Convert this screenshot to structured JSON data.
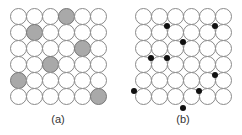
{
  "panels": [
    {
      "id": "a",
      "label": "(a)",
      "rows": 6,
      "cols": 6,
      "origin": [
        10,
        8
      ],
      "pitch": 16,
      "filled_cells": [
        [
          0,
          3
        ],
        [
          1,
          1
        ],
        [
          2,
          4
        ],
        [
          3,
          2
        ],
        [
          4,
          0
        ],
        [
          5,
          5
        ]
      ],
      "fill_color": "#a9a9a9"
    },
    {
      "id": "b",
      "label": "(b)",
      "rows": 6,
      "cols": 6,
      "origin": [
        135,
        8
      ],
      "pitch": 16,
      "dots": [
        [
          167,
          26
        ],
        [
          215,
          26
        ],
        [
          183,
          42
        ],
        [
          151,
          58
        ],
        [
          167,
          58
        ],
        [
          215,
          75
        ],
        [
          134,
          91
        ],
        [
          199,
          91
        ],
        [
          183,
          108
        ]
      ],
      "dot_color": "#111111"
    }
  ]
}
